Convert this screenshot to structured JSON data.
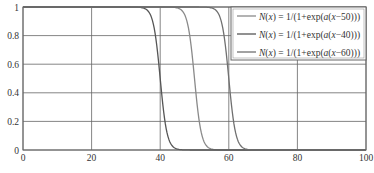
{
  "chart_data": {
    "type": "line",
    "title": "",
    "xlabel": "",
    "ylabel": "",
    "xlim": [
      0,
      100
    ],
    "ylim": [
      0,
      1
    ],
    "grid": true,
    "legend_position": "upper right",
    "x_ticks": [
      "0",
      "20",
      "40",
      "60",
      "80",
      "100"
    ],
    "y_ticks": [
      "0",
      "0.2",
      "0.4",
      "0.6",
      "0.8",
      "1"
    ],
    "function": "N(x) = 1/(1+exp(a(x-c)))",
    "a_estimated": 1,
    "series": [
      {
        "name": "N(x) = 1/(1+exp(a(x−50)))",
        "center": 50,
        "color": "#8a8a8a"
      },
      {
        "name": "N(x) = 1/(1+exp(a(x−40)))",
        "center": 40,
        "color": "#555555"
      },
      {
        "name": "N(x) = 1/(1+exp(a(x−60)))",
        "center": 60,
        "color": "#707070"
      }
    ],
    "sample_points": {
      "x": [
        0,
        35,
        38,
        40,
        42,
        45,
        48,
        50,
        52,
        55,
        58,
        60,
        62,
        65,
        70,
        100
      ],
      "c40": [
        1.0,
        0.993,
        0.881,
        0.5,
        0.119,
        0.007,
        0.0,
        0.0,
        0.0,
        0.0,
        0.0,
        0.0,
        0.0,
        0.0,
        0.0,
        0.0
      ],
      "c50": [
        1.0,
        1.0,
        1.0,
        1.0,
        1.0,
        0.993,
        0.881,
        0.5,
        0.119,
        0.007,
        0.0,
        0.0,
        0.0,
        0.0,
        0.0,
        0.0
      ],
      "c60": [
        1.0,
        1.0,
        1.0,
        1.0,
        1.0,
        1.0,
        1.0,
        1.0,
        1.0,
        0.993,
        0.881,
        0.5,
        0.119,
        0.007,
        0.0,
        0.0
      ]
    }
  },
  "legend": {
    "items": [
      {
        "prefix": "N",
        "arg": "(x)",
        "eq": " = 1/(1+exp(",
        "a": "a",
        "rest": "(",
        "x": "x",
        "tail": "−50)))"
      },
      {
        "prefix": "N",
        "arg": "(x)",
        "eq": " = 1/(1+exp(",
        "a": "a",
        "rest": "(",
        "x": "x",
        "tail": "−40)))"
      },
      {
        "prefix": "N",
        "arg": "(x)",
        "eq": " = 1/(1+exp(",
        "a": "a",
        "rest": "(",
        "x": "x",
        "tail": "−60)))"
      }
    ]
  }
}
